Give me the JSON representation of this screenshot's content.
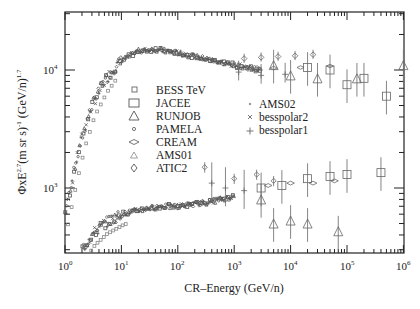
{
  "chart_data": {
    "type": "scatter",
    "title": "",
    "xlabel": "CR–Energy (GeV/n)",
    "ylabel": "ΦxE^2.7 (m sr s)^-1 (GeV/n)^1.7",
    "xscale": "log",
    "yscale": "log",
    "xlim": [
      1,
      1000000
    ],
    "ylim": [
      280,
      31000
    ],
    "x_ticks": [
      "10^0",
      "10^1",
      "10^2",
      "10^3",
      "10^4",
      "10^5",
      "10^6"
    ],
    "y_ticks": [
      "10^3",
      "10^4"
    ],
    "grid": false,
    "legend_position": "upper-center (two columns)",
    "legend": [
      {
        "label": "BESS TeV",
        "marker": "small-square"
      },
      {
        "label": "JACEE",
        "marker": "large-square"
      },
      {
        "label": "RUNJOB",
        "marker": "large-triangle"
      },
      {
        "label": "PAMELA",
        "marker": "small-circle"
      },
      {
        "label": "CREAM",
        "marker": "flat-diamond"
      },
      {
        "label": "AMS01",
        "marker": "small-triangle"
      },
      {
        "label": "ATIC2",
        "marker": "diamond"
      },
      {
        "label": "AMS02",
        "marker": "dot"
      },
      {
        "label": "besspolar2",
        "marker": "x"
      },
      {
        "label": "besspolar1",
        "marker": "plus"
      }
    ],
    "series": [
      {
        "name": "Protons (upper band, combined experiments)",
        "x": [
          1,
          1.5,
          2,
          3,
          5,
          7,
          10,
          20,
          40,
          100,
          300,
          1000,
          3000,
          10000,
          30000,
          100000
        ],
        "y": [
          600,
          1500,
          2700,
          5000,
          8000,
          10000,
          12000,
          14500,
          15000,
          14000,
          12500,
          11000,
          10000,
          10200,
          10500,
          9000
        ]
      },
      {
        "name": "Helium (lower band, combined experiments)",
        "x": [
          2,
          3,
          5,
          10,
          20,
          50,
          100,
          300,
          1000,
          3000,
          10000,
          30000,
          100000
        ],
        "y": [
          300,
          400,
          500,
          600,
          650,
          700,
          700,
          750,
          850,
          950,
          1000,
          1050,
          1100
        ]
      },
      {
        "name": "JACEE (protons, high energy)",
        "x": [
          20000,
          50000,
          100000,
          200000,
          500000
        ],
        "y": [
          10500,
          10000,
          7500,
          8500,
          6000
        ]
      },
      {
        "name": "RUNJOB (protons, high energy)",
        "x": [
          5000,
          10000,
          30000,
          150000,
          1000000
        ],
        "y": [
          11000,
          9000,
          8500,
          8500,
          11000
        ]
      },
      {
        "name": "JACEE (helium, high energy)",
        "x": [
          3000,
          7000,
          20000,
          50000,
          100000,
          400000
        ],
        "y": [
          1000,
          1050,
          1200,
          1250,
          1300,
          1350
        ]
      },
      {
        "name": "RUNJOB (helium, high energy)",
        "x": [
          3000,
          5000,
          10000,
          20000,
          70000
        ],
        "y": [
          800,
          500,
          530,
          500,
          430
        ]
      }
    ]
  },
  "labels": {
    "xlabel": "CR–Energy (GeV/n)",
    "ylabel_main": "ΦxE",
    "ylabel_exp1": "2.7",
    "ylabel_mid": "(m sr s)",
    "ylabel_exp2": "-1",
    "ylabel_end": " (GeV/n)",
    "ylabel_exp3": "1.7",
    "xticks": [
      {
        "base": "10",
        "exp": "0"
      },
      {
        "base": "10",
        "exp": "1"
      },
      {
        "base": "10",
        "exp": "2"
      },
      {
        "base": "10",
        "exp": "3"
      },
      {
        "base": "10",
        "exp": "4"
      },
      {
        "base": "10",
        "exp": "5"
      },
      {
        "base": "10",
        "exp": "6"
      }
    ],
    "yticks": [
      {
        "base": "10",
        "exp": "4"
      },
      {
        "base": "10",
        "exp": "3"
      }
    ]
  },
  "colors": {
    "axis": "#222222",
    "marker": "#666666",
    "dense": "#555555"
  }
}
